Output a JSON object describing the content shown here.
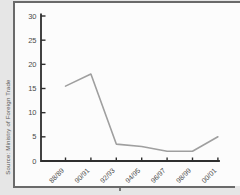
{
  "figure": {
    "source_label": "Source: Ministry of Foreign Trade"
  },
  "chart_data": {
    "type": "line",
    "categories": [
      "88/89",
      "90/91",
      "92/93",
      "94/95",
      "96/97",
      "98/99",
      "00/01"
    ],
    "values": [
      15.5,
      18,
      3.5,
      3,
      2,
      2,
      5
    ],
    "title": "",
    "xlabel": "",
    "ylabel": "",
    "ylim": [
      0,
      30
    ],
    "yticks": [
      0,
      5,
      10,
      15,
      20,
      25,
      30
    ],
    "grid": false,
    "legend": "none",
    "line_color": "#9f9f9f",
    "axis_color": "#2e2e2e",
    "label_color": "#4a4a4a"
  },
  "colors": {
    "outer_background": "#e6e6e6",
    "panel_background": "#fcfcfc",
    "frame_border": "#6a6a6a"
  }
}
